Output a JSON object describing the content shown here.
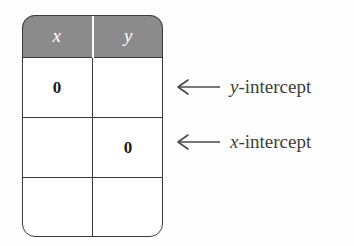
{
  "figure": {
    "name": "intercepts-table-figure",
    "colors": {
      "header_fill": "#8b8b8b",
      "header_text": "#ffffff",
      "grid_line": "#3a3a3a",
      "annotation": "#4a4a4a",
      "page_background": "#fdfdfd",
      "cell_background": "#ffffff"
    }
  },
  "table": {
    "headers": [
      "x",
      "y"
    ],
    "rows": [
      [
        "0",
        ""
      ],
      [
        "",
        "0"
      ],
      [
        "",
        ""
      ]
    ]
  },
  "annotations": [
    {
      "arrow_icon": "left-arrow-icon",
      "arrow_glyph": "←",
      "variable": "y",
      "suffix": "-intercept",
      "full_text": "y-intercept",
      "target_row": 0
    },
    {
      "arrow_icon": "left-arrow-icon",
      "arrow_glyph": "←",
      "variable": "x",
      "suffix": "-intercept",
      "full_text": "x-intercept",
      "target_row": 1
    }
  ]
}
